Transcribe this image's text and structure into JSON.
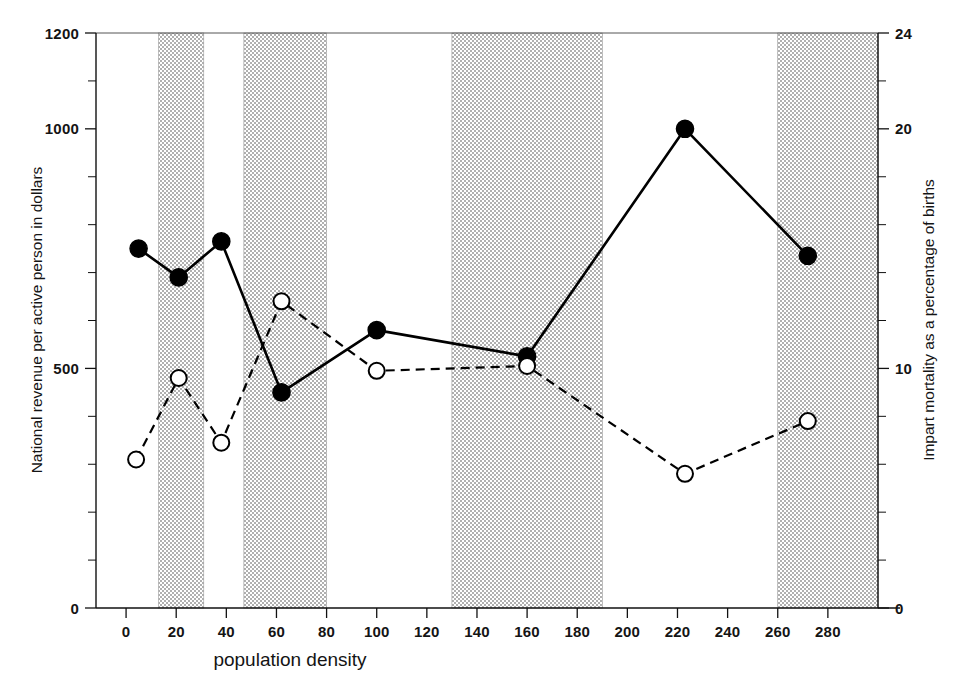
{
  "figure": {
    "background": "#ffffff",
    "ink_color": "#000000",
    "band_fill": "#efefef"
  },
  "axes": {
    "x": {
      "title": "population density",
      "tick_labels": [
        "0",
        "20",
        "40",
        "60",
        "80",
        "100",
        "120",
        "140",
        "160",
        "180",
        "200",
        "220",
        "240",
        "260",
        "280"
      ],
      "tick_values": [
        0,
        20,
        40,
        60,
        80,
        100,
        120,
        140,
        160,
        180,
        200,
        220,
        240,
        260,
        280
      ],
      "range": [
        -12,
        300
      ]
    },
    "y_left": {
      "title": "National revenue per active person in dollars",
      "tick_labels": [
        "0",
        "500",
        "1000",
        "1200"
      ],
      "tick_values": [
        0,
        500,
        1000,
        1200
      ],
      "minor_step": 100,
      "range": [
        0,
        1200
      ]
    },
    "y_right": {
      "title": "Impart mortality as a percentage of births",
      "tick_labels": [
        "0",
        "10",
        "20",
        "24"
      ],
      "tick_values": [
        0,
        10,
        20,
        24
      ],
      "minor_step": 2,
      "range": [
        0,
        24
      ]
    }
  },
  "bands": [
    {
      "label": "band-1",
      "x_start": 13,
      "x_end": 31
    },
    {
      "label": "band-2",
      "x_start": 47,
      "x_end": 80
    },
    {
      "label": "band-3",
      "x_start": 130,
      "x_end": 190
    },
    {
      "label": "band-4",
      "x_start": 260,
      "x_end": 300
    }
  ],
  "chart_data": {
    "type": "line",
    "title": "",
    "xlabel": "population density",
    "ylabel": "National revenue per active person in dollars",
    "y2label": "Impart mortality as a percentage of births",
    "xlim": [
      -12,
      300
    ],
    "ylim": [
      0,
      1200
    ],
    "y2lim": [
      0,
      24
    ],
    "grid": false,
    "legend": "none",
    "shaded_bands_x": [
      [
        13,
        31
      ],
      [
        47,
        80
      ],
      [
        130,
        190
      ],
      [
        260,
        300
      ]
    ],
    "series": [
      {
        "name": "National revenue per active person in dollars",
        "axis": "left",
        "marker": "filled-circle",
        "line_style": "solid",
        "x": [
          5,
          21,
          38,
          62,
          100,
          160,
          223,
          272
        ],
        "values": [
          750,
          690,
          765,
          450,
          580,
          525,
          1000,
          735
        ]
      },
      {
        "name": "Impart mortality as a percentage of births",
        "axis": "right",
        "marker": "open-circle",
        "line_style": "dashed",
        "x": [
          4,
          21,
          38,
          62,
          100,
          160,
          223,
          272
        ],
        "values": [
          6.2,
          9.6,
          6.9,
          12.8,
          9.9,
          10.1,
          5.6,
          7.8
        ]
      }
    ]
  },
  "caption": {
    "text": ""
  }
}
